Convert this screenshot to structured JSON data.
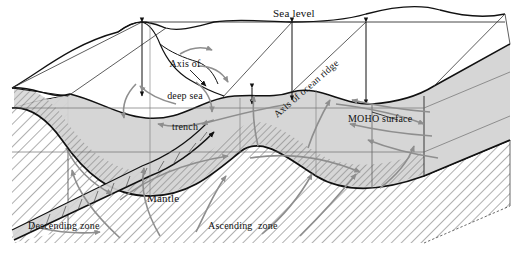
{
  "figure": {
    "type": "geological-block-diagram",
    "colors": {
      "line": "#111111",
      "crust_gray": "#d2d2d2",
      "mantle_hatch": "#666666",
      "flow_arrow": "#8a8a8a",
      "thin_rule": "#555555",
      "background": "#ffffff"
    }
  },
  "labels": {
    "sea_level": "Sea level",
    "axis_deep_sea_trench": "Axis of\ndeep sea\ntrench",
    "axis_of_ocean_ridge": "Axis of ocean ridge",
    "moho_surface": "MOHO surface",
    "mantle": "Mantle",
    "descending_zone": "Descending zone",
    "ascending_zone": "Ascending  zone"
  },
  "legend_hint": {
    "crust_layer": "ocean crust (light gray band)",
    "mantle_layer": "mantle (diagonal hatch)",
    "convection": "gray curved arrows show convection flow"
  }
}
